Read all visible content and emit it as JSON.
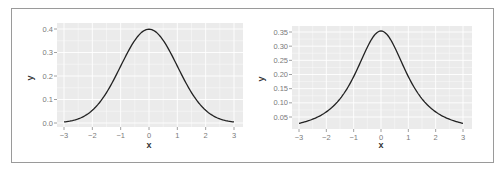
{
  "chart_data": [
    {
      "type": "line",
      "title": "",
      "xlabel": "x",
      "ylabel": "y",
      "xlim": [
        -3,
        3
      ],
      "ylim": [
        0,
        0.4
      ],
      "x_ticks": [
        -3,
        -2,
        -1,
        0,
        1,
        2,
        3
      ],
      "y_ticks": [
        0.0,
        0.1,
        0.2,
        0.3,
        0.4
      ],
      "y_tick_labels": [
        "0.0",
        "0.1",
        "0.2",
        "0.3",
        "0.4"
      ],
      "grid": true,
      "description": "Standard normal density",
      "series": [
        {
          "name": "density",
          "x": [
            -3,
            -2.5,
            -2,
            -1.5,
            -1,
            -0.5,
            0,
            0.5,
            1,
            1.5,
            2,
            2.5,
            3
          ],
          "values": [
            0.004,
            0.018,
            0.054,
            0.13,
            0.242,
            0.352,
            0.399,
            0.352,
            0.242,
            0.13,
            0.054,
            0.018,
            0.004
          ]
        }
      ]
    },
    {
      "type": "line",
      "title": "",
      "xlabel": "x",
      "ylabel": "y",
      "xlim": [
        -3,
        3
      ],
      "ylim": [
        0.027,
        0.354
      ],
      "x_ticks": [
        -3,
        -2,
        -1,
        0,
        1,
        2,
        3
      ],
      "y_ticks": [
        0.05,
        0.1,
        0.15,
        0.2,
        0.25,
        0.3,
        0.35
      ],
      "y_tick_labels": [
        "0.05",
        "0.10",
        "0.15",
        "0.20",
        "0.25",
        "0.30",
        "0.35"
      ],
      "grid": true,
      "description": "Heavy-tailed (t, df=2) density",
      "series": [
        {
          "name": "density",
          "x": [
            -3,
            -2.5,
            -2,
            -1.5,
            -1,
            -0.5,
            0,
            0.5,
            1,
            1.5,
            2,
            2.5,
            3
          ],
          "values": [
            0.027,
            0.041,
            0.068,
            0.117,
            0.192,
            0.283,
            0.354,
            0.283,
            0.192,
            0.117,
            0.068,
            0.041,
            0.027
          ]
        }
      ]
    }
  ],
  "colors": {
    "panel_bg": "#ebebeb",
    "grid": "#ffffff",
    "line": "#222222",
    "tick_text": "#7a7a7a",
    "frame": "#9a9a9a"
  },
  "left_chart": {
    "xlabel": "x",
    "ylabel": "y",
    "y_tick_labels": [
      "0.0",
      "0.1",
      "0.2",
      "0.3",
      "0.4"
    ],
    "x_tick_labels": [
      "-3",
      "-2",
      "-1",
      "0",
      "1",
      "2",
      "3"
    ]
  },
  "right_chart": {
    "xlabel": "x",
    "ylabel": "y",
    "y_tick_labels": [
      "0.05",
      "0.10",
      "0.15",
      "0.20",
      "0.25",
      "0.30",
      "0.35"
    ],
    "x_tick_labels": [
      "-3",
      "-2",
      "-1",
      "0",
      "1",
      "2",
      "3"
    ]
  }
}
